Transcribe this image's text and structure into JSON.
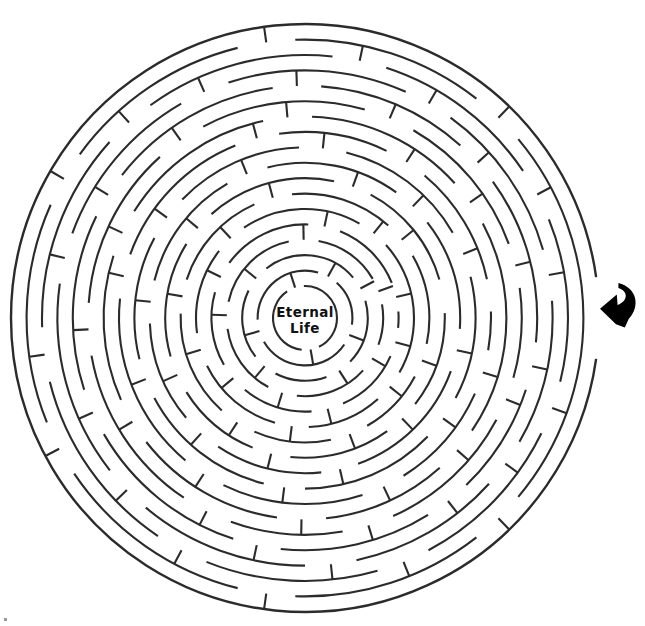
{
  "page": {
    "background_color": "#ffffff",
    "width": 645,
    "height": 626
  },
  "maze": {
    "type": "circular-maze",
    "center_x": 305,
    "center_y": 318,
    "inner_radius": 32,
    "ring_spacing": 15.4,
    "ring_count": 18,
    "outer_radius": 294,
    "wall_color": "#2b2b2b",
    "wall_width": 2.1,
    "entrance_angle_deg": 0,
    "entrance_side": "right",
    "goal": "center"
  },
  "center_label": {
    "line1": "Eternal",
    "line2": "Life",
    "color": "#111111",
    "font_size": "13.5px",
    "weight": "bold"
  },
  "entry_arrow": {
    "name": "curved-arrow-pointing-left",
    "color": "#000000",
    "x": 600,
    "y": 282,
    "width": 40,
    "height": 46,
    "direction": "left",
    "meaning": "maze entrance"
  },
  "artifact": {
    "name": "corner-speck",
    "x": 4,
    "y": 618,
    "size": 3,
    "color": "#9a9a9a"
  },
  "rings": [
    {
      "index": 0,
      "radius": 32,
      "gaps_deg": [
        [
          64,
          96
        ],
        [
          236,
          268
        ]
      ]
    },
    {
      "index": 1,
      "radius": 47.4,
      "gaps_deg": [
        [
          8,
          34
        ],
        [
          150,
          178
        ],
        [
          286,
          312
        ]
      ]
    },
    {
      "index": 2,
      "radius": 62.8,
      "gaps_deg": [
        [
          44,
          70
        ],
        [
          118,
          142
        ],
        [
          206,
          232
        ],
        [
          320,
          344
        ]
      ]
    },
    {
      "index": 3,
      "radius": 78.2,
      "gaps_deg": [
        [
          20,
          42
        ],
        [
          96,
          118
        ],
        [
          172,
          192
        ],
        [
          258,
          280
        ],
        [
          330,
          350
        ]
      ]
    },
    {
      "index": 4,
      "radius": 93.6,
      "gaps_deg": [
        [
          6,
          24
        ],
        [
          66,
          86
        ],
        [
          130,
          150
        ],
        [
          196,
          216
        ],
        [
          272,
          292
        ],
        [
          338,
          356
        ]
      ]
    },
    {
      "index": 5,
      "radius": 109.0,
      "gaps_deg": [
        [
          30,
          48
        ],
        [
          88,
          106
        ],
        [
          154,
          172
        ],
        [
          218,
          236
        ],
        [
          300,
          318
        ]
      ]
    },
    {
      "index": 6,
      "radius": 124.4,
      "gaps_deg": [
        [
          12,
          28
        ],
        [
          60,
          78
        ],
        [
          114,
          132
        ],
        [
          182,
          198
        ],
        [
          246,
          264
        ],
        [
          312,
          330
        ]
      ]
    },
    {
      "index": 7,
      "radius": 139.8,
      "gaps_deg": [
        [
          38,
          54
        ],
        [
          96,
          112
        ],
        [
          148,
          164
        ],
        [
          212,
          228
        ],
        [
          282,
          298
        ],
        [
          344,
          358
        ]
      ]
    },
    {
      "index": 8,
      "radius": 155.2,
      "gaps_deg": [
        [
          4,
          20
        ],
        [
          70,
          84
        ],
        [
          124,
          140
        ],
        [
          178,
          194
        ],
        [
          240,
          256
        ],
        [
          306,
          322
        ]
      ]
    },
    {
      "index": 9,
      "radius": 170.6,
      "gaps_deg": [
        [
          28,
          44
        ],
        [
          90,
          104
        ],
        [
          152,
          166
        ],
        [
          208,
          224
        ],
        [
          268,
          284
        ],
        [
          330,
          346
        ]
      ]
    },
    {
      "index": 10,
      "radius": 186.0,
      "gaps_deg": [
        [
          10,
          24
        ],
        [
          58,
          72
        ],
        [
          116,
          130
        ],
        [
          186,
          200
        ],
        [
          248,
          262
        ],
        [
          296,
          310
        ],
        [
          348,
          358
        ]
      ]
    },
    {
      "index": 11,
      "radius": 201.4,
      "gaps_deg": [
        [
          34,
          48
        ],
        [
          84,
          98
        ],
        [
          142,
          156
        ],
        [
          198,
          212
        ],
        [
          258,
          272
        ],
        [
          318,
          332
        ]
      ]
    },
    {
      "index": 12,
      "radius": 216.8,
      "gaps_deg": [
        [
          16,
          28
        ],
        [
          66,
          80
        ],
        [
          110,
          124
        ],
        [
          170,
          184
        ],
        [
          228,
          242
        ],
        [
          286,
          300
        ],
        [
          340,
          352
        ]
      ]
    },
    {
      "index": 13,
      "radius": 232.2,
      "gaps_deg": [
        [
          6,
          18
        ],
        [
          46,
          58
        ],
        [
          96,
          108
        ],
        [
          150,
          162
        ],
        [
          206,
          218
        ],
        [
          262,
          274
        ],
        [
          312,
          324
        ]
      ]
    },
    {
      "index": 14,
      "radius": 247.6,
      "gaps_deg": [
        [
          30,
          42
        ],
        [
          78,
          90
        ],
        [
          130,
          142
        ],
        [
          188,
          200
        ],
        [
          240,
          252
        ],
        [
          294,
          306
        ],
        [
          344,
          356
        ]
      ]
    },
    {
      "index": 15,
      "radius": 263.0,
      "gaps_deg": [
        [
          14,
          26
        ],
        [
          62,
          74
        ],
        [
          112,
          124
        ],
        [
          166,
          178
        ],
        [
          222,
          234
        ],
        [
          276,
          288
        ],
        [
          326,
          338
        ]
      ]
    },
    {
      "index": 16,
      "radius": 278.4,
      "gaps_deg": [
        [
          40,
          52
        ],
        [
          92,
          104
        ],
        [
          146,
          158
        ],
        [
          204,
          216
        ],
        [
          256,
          268
        ],
        [
          308,
          320
        ]
      ]
    },
    {
      "index": 17,
      "radius": 294.0,
      "gaps_deg": [
        [
          352,
          8
        ]
      ]
    }
  ],
  "spokes": [
    {
      "ring_from": 0,
      "ring_to": 1,
      "angle_deg": 80
    },
    {
      "ring_from": 0,
      "ring_to": 1,
      "angle_deg": 252
    },
    {
      "ring_from": 1,
      "ring_to": 2,
      "angle_deg": 21
    },
    {
      "ring_from": 1,
      "ring_to": 2,
      "angle_deg": 164
    },
    {
      "ring_from": 1,
      "ring_to": 2,
      "angle_deg": 299
    },
    {
      "ring_from": 2,
      "ring_to": 3,
      "angle_deg": 57
    },
    {
      "ring_from": 2,
      "ring_to": 3,
      "angle_deg": 130
    },
    {
      "ring_from": 2,
      "ring_to": 3,
      "angle_deg": 219
    },
    {
      "ring_from": 2,
      "ring_to": 3,
      "angle_deg": 332
    },
    {
      "ring_from": 3,
      "ring_to": 4,
      "angle_deg": 31
    },
    {
      "ring_from": 3,
      "ring_to": 4,
      "angle_deg": 107
    },
    {
      "ring_from": 3,
      "ring_to": 4,
      "angle_deg": 182
    },
    {
      "ring_from": 3,
      "ring_to": 4,
      "angle_deg": 269
    },
    {
      "ring_from": 3,
      "ring_to": 4,
      "angle_deg": 340
    },
    {
      "ring_from": 4,
      "ring_to": 5,
      "angle_deg": 15
    },
    {
      "ring_from": 4,
      "ring_to": 5,
      "angle_deg": 76
    },
    {
      "ring_from": 4,
      "ring_to": 5,
      "angle_deg": 140
    },
    {
      "ring_from": 4,
      "ring_to": 5,
      "angle_deg": 206
    },
    {
      "ring_from": 4,
      "ring_to": 5,
      "angle_deg": 282
    },
    {
      "ring_from": 4,
      "ring_to": 5,
      "angle_deg": 347
    },
    {
      "ring_from": 5,
      "ring_to": 6,
      "angle_deg": 39
    },
    {
      "ring_from": 5,
      "ring_to": 6,
      "angle_deg": 97
    },
    {
      "ring_from": 5,
      "ring_to": 6,
      "angle_deg": 163
    },
    {
      "ring_from": 5,
      "ring_to": 6,
      "angle_deg": 227
    },
    {
      "ring_from": 5,
      "ring_to": 6,
      "angle_deg": 309
    },
    {
      "ring_from": 6,
      "ring_to": 7,
      "angle_deg": 20
    },
    {
      "ring_from": 6,
      "ring_to": 7,
      "angle_deg": 69
    },
    {
      "ring_from": 6,
      "ring_to": 7,
      "angle_deg": 123
    },
    {
      "ring_from": 6,
      "ring_to": 7,
      "angle_deg": 190
    },
    {
      "ring_from": 6,
      "ring_to": 7,
      "angle_deg": 255
    },
    {
      "ring_from": 6,
      "ring_to": 7,
      "angle_deg": 321
    },
    {
      "ring_from": 7,
      "ring_to": 8,
      "angle_deg": 46
    },
    {
      "ring_from": 7,
      "ring_to": 8,
      "angle_deg": 104
    },
    {
      "ring_from": 7,
      "ring_to": 8,
      "angle_deg": 156
    },
    {
      "ring_from": 7,
      "ring_to": 8,
      "angle_deg": 220
    },
    {
      "ring_from": 7,
      "ring_to": 8,
      "angle_deg": 290
    },
    {
      "ring_from": 8,
      "ring_to": 9,
      "angle_deg": 12
    },
    {
      "ring_from": 8,
      "ring_to": 9,
      "angle_deg": 77
    },
    {
      "ring_from": 8,
      "ring_to": 9,
      "angle_deg": 132
    },
    {
      "ring_from": 8,
      "ring_to": 9,
      "angle_deg": 186
    },
    {
      "ring_from": 8,
      "ring_to": 9,
      "angle_deg": 248
    },
    {
      "ring_from": 8,
      "ring_to": 9,
      "angle_deg": 314
    },
    {
      "ring_from": 9,
      "ring_to": 10,
      "angle_deg": 36
    },
    {
      "ring_from": 9,
      "ring_to": 10,
      "angle_deg": 97
    },
    {
      "ring_from": 9,
      "ring_to": 10,
      "angle_deg": 159
    },
    {
      "ring_from": 9,
      "ring_to": 10,
      "angle_deg": 216
    },
    {
      "ring_from": 9,
      "ring_to": 10,
      "angle_deg": 276
    },
    {
      "ring_from": 9,
      "ring_to": 10,
      "angle_deg": 338
    },
    {
      "ring_from": 10,
      "ring_to": 11,
      "angle_deg": 17
    },
    {
      "ring_from": 10,
      "ring_to": 11,
      "angle_deg": 65
    },
    {
      "ring_from": 10,
      "ring_to": 11,
      "angle_deg": 123
    },
    {
      "ring_from": 10,
      "ring_to": 11,
      "angle_deg": 193
    },
    {
      "ring_from": 10,
      "ring_to": 11,
      "angle_deg": 255
    },
    {
      "ring_from": 10,
      "ring_to": 11,
      "angle_deg": 303
    },
    {
      "ring_from": 11,
      "ring_to": 12,
      "angle_deg": 41
    },
    {
      "ring_from": 11,
      "ring_to": 12,
      "angle_deg": 91
    },
    {
      "ring_from": 11,
      "ring_to": 12,
      "angle_deg": 149
    },
    {
      "ring_from": 11,
      "ring_to": 12,
      "angle_deg": 205
    },
    {
      "ring_from": 11,
      "ring_to": 12,
      "angle_deg": 265
    },
    {
      "ring_from": 11,
      "ring_to": 12,
      "angle_deg": 325
    },
    {
      "ring_from": 12,
      "ring_to": 13,
      "angle_deg": 22
    },
    {
      "ring_from": 12,
      "ring_to": 13,
      "angle_deg": 73
    },
    {
      "ring_from": 12,
      "ring_to": 13,
      "angle_deg": 117
    },
    {
      "ring_from": 12,
      "ring_to": 13,
      "angle_deg": 177
    },
    {
      "ring_from": 12,
      "ring_to": 13,
      "angle_deg": 235
    },
    {
      "ring_from": 12,
      "ring_to": 13,
      "angle_deg": 293
    },
    {
      "ring_from": 12,
      "ring_to": 13,
      "angle_deg": 346
    },
    {
      "ring_from": 13,
      "ring_to": 14,
      "angle_deg": 12
    },
    {
      "ring_from": 13,
      "ring_to": 14,
      "angle_deg": 52
    },
    {
      "ring_from": 13,
      "ring_to": 14,
      "angle_deg": 102
    },
    {
      "ring_from": 13,
      "ring_to": 14,
      "angle_deg": 156
    },
    {
      "ring_from": 13,
      "ring_to": 14,
      "angle_deg": 212
    },
    {
      "ring_from": 13,
      "ring_to": 14,
      "angle_deg": 268
    },
    {
      "ring_from": 13,
      "ring_to": 14,
      "angle_deg": 318
    },
    {
      "ring_from": 14,
      "ring_to": 15,
      "angle_deg": 36
    },
    {
      "ring_from": 14,
      "ring_to": 15,
      "angle_deg": 84
    },
    {
      "ring_from": 14,
      "ring_to": 15,
      "angle_deg": 136
    },
    {
      "ring_from": 14,
      "ring_to": 15,
      "angle_deg": 194
    },
    {
      "ring_from": 14,
      "ring_to": 15,
      "angle_deg": 246
    },
    {
      "ring_from": 14,
      "ring_to": 15,
      "angle_deg": 300
    },
    {
      "ring_from": 14,
      "ring_to": 15,
      "angle_deg": 350
    },
    {
      "ring_from": 15,
      "ring_to": 16,
      "angle_deg": 20
    },
    {
      "ring_from": 15,
      "ring_to": 16,
      "angle_deg": 68
    },
    {
      "ring_from": 15,
      "ring_to": 16,
      "angle_deg": 118
    },
    {
      "ring_from": 15,
      "ring_to": 16,
      "angle_deg": 172
    },
    {
      "ring_from": 15,
      "ring_to": 16,
      "angle_deg": 228
    },
    {
      "ring_from": 15,
      "ring_to": 16,
      "angle_deg": 282
    },
    {
      "ring_from": 15,
      "ring_to": 16,
      "angle_deg": 332
    },
    {
      "ring_from": 16,
      "ring_to": 17,
      "angle_deg": 46
    },
    {
      "ring_from": 16,
      "ring_to": 17,
      "angle_deg": 98
    },
    {
      "ring_from": 16,
      "ring_to": 17,
      "angle_deg": 152
    },
    {
      "ring_from": 16,
      "ring_to": 17,
      "angle_deg": 210
    },
    {
      "ring_from": 16,
      "ring_to": 17,
      "angle_deg": 262
    },
    {
      "ring_from": 16,
      "ring_to": 17,
      "angle_deg": 314
    }
  ]
}
